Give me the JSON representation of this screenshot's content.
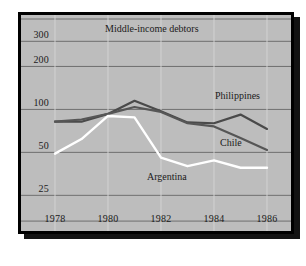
{
  "chart_data": {
    "type": "line",
    "title": "Middle-income debtors",
    "xlabel": "",
    "ylabel": "",
    "yscale": "log",
    "ylim": [
      15,
      430
    ],
    "xlim": [
      1978,
      1986
    ],
    "grid": true,
    "legend_position": "inline-annotations",
    "ytick_labels": [
      "300",
      "200",
      "100",
      "50",
      "25"
    ],
    "ytick_values": [
      300,
      200,
      100,
      50,
      25
    ],
    "xtick_labels": [
      "1978",
      "1980",
      "1982",
      "1984",
      "1986"
    ],
    "xtick_values": [
      1978,
      1980,
      1982,
      1984,
      1986
    ],
    "x": [
      1978,
      1979,
      1980,
      1981,
      1982,
      1983,
      1984,
      1985,
      1986
    ],
    "series": [
      {
        "name": "Philippines",
        "color": "#4a4a4a",
        "values": [
          82,
          82,
          93,
          115,
          97,
          81,
          80,
          92,
          73
        ]
      },
      {
        "name": "Chile",
        "color": "#565656",
        "values": [
          82,
          85,
          93,
          104,
          96,
          80,
          76,
          63,
          52
        ]
      },
      {
        "name": "Argentina",
        "color": "#ffffff",
        "values": [
          49,
          62,
          90,
          88,
          46,
          40,
          44,
          39,
          39
        ]
      }
    ]
  },
  "labels": {
    "philippines": "Philippines",
    "chile": "Chile",
    "argentina": "Argentina"
  }
}
